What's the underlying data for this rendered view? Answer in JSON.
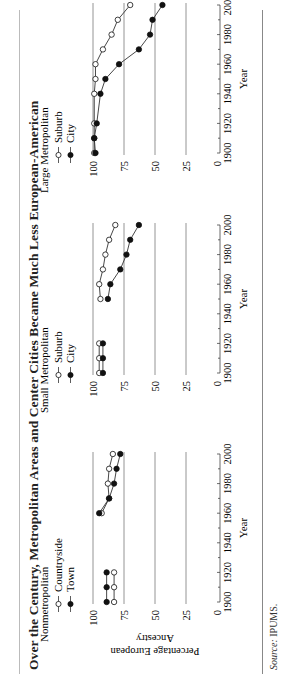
{
  "title": "Over the Century, Metropolitan Areas and Center Cities Became Much Less European-American",
  "source": {
    "label": "Source:",
    "text": "IPUMS."
  },
  "y_axis_label_line1": "Percentage European",
  "y_axis_label_line2": "Ancestry",
  "chart_data": [
    {
      "type": "line",
      "title": "Nonmetropolitan",
      "xlabel": "Year",
      "ylabel": "Percentage European Ancestry",
      "xlim": [
        1900,
        2000
      ],
      "ylim": [
        0,
        100
      ],
      "xticks": [
        1900,
        1920,
        1940,
        1960,
        1980,
        2000
      ],
      "yticks": [
        0,
        25,
        50,
        75,
        100
      ],
      "grid": "horizontal",
      "legend_position": "top-left",
      "series": [
        {
          "name": "Countryside",
          "marker": "open-circle",
          "x": [
            1900,
            1910,
            1920,
            1960,
            1970,
            1980,
            1990,
            2000
          ],
          "y": [
            83,
            83,
            83,
            93,
            87,
            88,
            87,
            84
          ]
        },
        {
          "name": "Town",
          "marker": "filled-circle",
          "x": [
            1900,
            1910,
            1920,
            1960,
            1970,
            1980,
            1990,
            2000
          ],
          "y": [
            89,
            89,
            89,
            95,
            87,
            83,
            81,
            78
          ]
        }
      ]
    },
    {
      "type": "line",
      "title": "Small Metropolitan",
      "xlabel": "Year",
      "ylabel": "",
      "xlim": [
        1900,
        2000
      ],
      "ylim": [
        0,
        100
      ],
      "xticks": [
        1900,
        1920,
        1940,
        1960,
        1980,
        2000
      ],
      "yticks": [
        0,
        25,
        50,
        75,
        100
      ],
      "grid": "horizontal",
      "legend_position": "top-left",
      "series": [
        {
          "name": "Suburb",
          "marker": "open-circle",
          "x": [
            1900,
            1910,
            1920,
            1950,
            1960,
            1970,
            1980,
            1990,
            2000
          ],
          "y": [
            95,
            95,
            95,
            94,
            95,
            92,
            90,
            87,
            82
          ]
        },
        {
          "name": "City",
          "marker": "filled-circle",
          "x": [
            1900,
            1910,
            1920,
            1950,
            1960,
            1970,
            1980,
            1990,
            2000
          ],
          "y": [
            92,
            92,
            92,
            88,
            86,
            78,
            73,
            70,
            63
          ]
        }
      ]
    },
    {
      "type": "line",
      "title": "Large Metropolitan",
      "xlabel": "Year",
      "ylabel": "",
      "xlim": [
        1900,
        2000
      ],
      "ylim": [
        0,
        100
      ],
      "xticks": [
        1900,
        1920,
        1940,
        1960,
        1980,
        2000
      ],
      "yticks": [
        0,
        25,
        50,
        75,
        100
      ],
      "grid": "horizontal",
      "legend_position": "top-left",
      "series": [
        {
          "name": "Suburb",
          "marker": "open-circle",
          "x": [
            1900,
            1910,
            1920,
            1940,
            1950,
            1960,
            1970,
            1980,
            1990,
            2000
          ],
          "y": [
            99,
            99,
            99,
            99,
            98,
            98,
            92,
            85,
            80,
            70
          ]
        },
        {
          "name": "City",
          "marker": "filled-circle",
          "x": [
            1900,
            1910,
            1920,
            1940,
            1950,
            1960,
            1970,
            1980,
            1990,
            2000
          ],
          "y": [
            98,
            99,
            97,
            94,
            90,
            79,
            63,
            54,
            52,
            44
          ]
        }
      ]
    }
  ]
}
